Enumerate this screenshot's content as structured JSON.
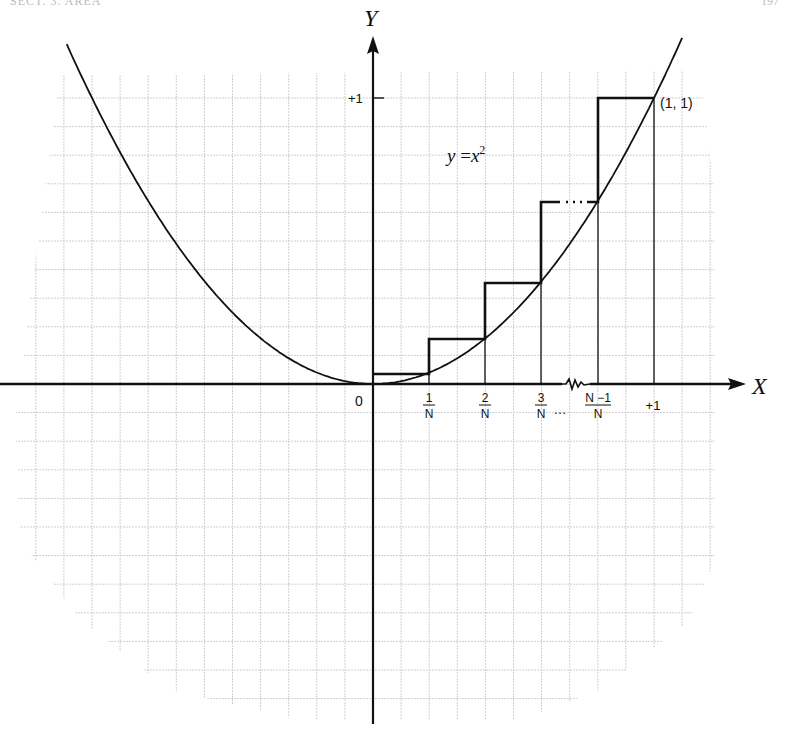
{
  "page": {
    "header_left": "SECT. 3. AREA",
    "header_right": "197"
  },
  "figure": {
    "equation_label": "y = x²",
    "axis_labels": {
      "x": "X",
      "y": "Y"
    },
    "y_tick_label": "+1",
    "origin_label": "0",
    "x_tick_labels": [
      {
        "num": "1",
        "den": "N"
      },
      {
        "num": "2",
        "den": "N"
      },
      {
        "num": "3",
        "den": "N",
        "suffix": "…"
      },
      {
        "num": "N −1",
        "den": "N"
      },
      {
        "plain": "+1"
      }
    ],
    "point_label": "(1, 1)",
    "colors": {
      "ink": "#111111",
      "grid": "#c8c8c8",
      "background": "#ffffff"
    }
  },
  "chart_data": {
    "type": "line",
    "function": "y = x^2",
    "xlabel": "X",
    "ylabel": "Y",
    "x_ticks": [
      "0",
      "1/N",
      "2/N",
      "3/N",
      "(N-1)/N",
      "+1"
    ],
    "y_ticks": [
      "+1"
    ],
    "xlim": [
      -1.3,
      1.3
    ],
    "ylim": [
      -1.2,
      1.15
    ],
    "grid": true,
    "annotations": [
      "y = x²",
      "(1, 1)",
      "axis break between 3/N and (N-1)/N",
      "dotted continuation of step at (N-1)/N"
    ],
    "step_rectangles": {
      "description": "Upper sums: each rectangle on [(k-1)/N, k/N] has height (k/N)²",
      "intervals": [
        {
          "x_from": "0",
          "x_to": "1/N",
          "height": "(1/N)²"
        },
        {
          "x_from": "1/N",
          "x_to": "2/N",
          "height": "(2/N)²"
        },
        {
          "x_from": "2/N",
          "x_to": "3/N",
          "height": "(3/N)²"
        },
        {
          "x_from": "3/N",
          "x_to": "(N-1)/N",
          "height": "((N-1)/N)²"
        },
        {
          "x_from": "(N-1)/N",
          "x_to": "1",
          "height": "1"
        }
      ]
    },
    "series": [
      {
        "name": "y = x^2",
        "x": [
          -1.1,
          -1,
          -0.5,
          0,
          0.5,
          1,
          1.1
        ],
        "values": [
          1.21,
          1,
          0.25,
          0,
          0.25,
          1,
          1.21
        ]
      }
    ]
  }
}
